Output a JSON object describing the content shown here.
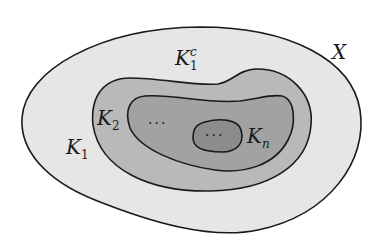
{
  "diagram": {
    "colors": {
      "background": "#ffffff",
      "stroke": "#1a1a1a",
      "region_X": "#e6e6e6",
      "region_K1": "#b9b9b9",
      "region_K2": "#a2a2a2",
      "region_Kn": "#8c8c8c"
    },
    "regions": [
      {
        "id": "X",
        "description": "outer space X"
      },
      {
        "id": "K1",
        "description": "set K1"
      },
      {
        "id": "K2",
        "description": "set K2"
      },
      {
        "id": "Kn",
        "description": "set Kn"
      }
    ],
    "labels": {
      "X": {
        "base": "X"
      },
      "K1c": {
        "base": "K",
        "sub": "1",
        "sup": "c"
      },
      "K1": {
        "base": "K",
        "sub": "1"
      },
      "K2": {
        "base": "K",
        "sub": "2"
      },
      "Kn": {
        "base": "K",
        "sub": "n"
      },
      "dots_outer": "···",
      "dots_inner": "···"
    }
  }
}
